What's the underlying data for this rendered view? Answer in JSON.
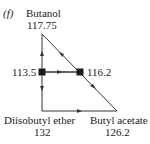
{
  "panel_label": "(f)",
  "vertices": {
    "top": {
      "name": "Butanol",
      "value": "117.75"
    },
    "bottom_left": {
      "name": "Diisobutyl ether",
      "value": "132"
    },
    "bottom_right": {
      "name": "Butyl acetate",
      "value": "126.2"
    }
  },
  "nodes": {
    "left": {
      "value": "113.5"
    },
    "right": {
      "value": "116.2"
    }
  },
  "colors": {
    "line": "#333333",
    "node": "#1a1a1a"
  }
}
